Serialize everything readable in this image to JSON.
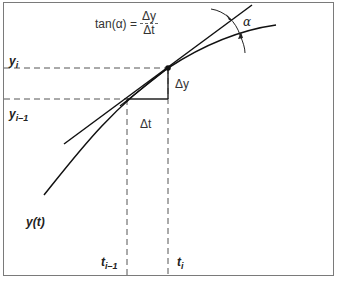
{
  "diagram": {
    "type": "tangent-slope-illustration",
    "formula": {
      "lhs": "tan(α) =",
      "numerator": "Δy",
      "denominator": "Δt"
    },
    "labels": {
      "y_i": "y",
      "y_i_sub": "i",
      "y_i1": "y",
      "y_i1_sub": "i–1",
      "t_i": "t",
      "t_i_sub": "i",
      "t_i1": "t",
      "t_i1_sub": "i–1",
      "curve": "y(t)",
      "delta_y": "Δy",
      "delta_t": "Δt",
      "angle": "α"
    },
    "colors": {
      "line": "#111111",
      "dashed": "#555555",
      "frame": "#7a7a7a"
    }
  }
}
